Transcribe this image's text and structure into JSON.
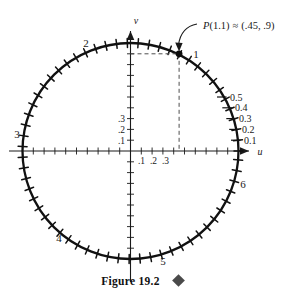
{
  "figure": {
    "caption": "Figure 19.2",
    "caption_marker": "filled-diamond",
    "background_color": "#ffffff",
    "ink_color": "#1a1a1a"
  },
  "axes": {
    "horizontal_label": "u",
    "vertical_label": "v",
    "horizontal_tick_labels": [
      ".1",
      ".2",
      ".3"
    ],
    "vertical_tick_labels": [
      ".1",
      ".2",
      ".3"
    ]
  },
  "circle": {
    "arc_length_labels": [
      "1",
      "2",
      "3",
      "4",
      "5",
      "6"
    ],
    "radius_tick_labels": [
      "0.1",
      "0.2",
      "0.3",
      "0.4",
      "0.5"
    ]
  },
  "point": {
    "annotation": "P(1.1) ≈ (.45, .9)",
    "annotation_prefix": "P",
    "annotation_arg": "(1.1)",
    "annotation_relation": "≈",
    "annotation_value": "(.45, .9)",
    "u": 0.45,
    "v": 0.9
  },
  "chart_data": {
    "type": "scatter",
    "title": "Figure 19.2",
    "xlabel": "u",
    "ylabel": "v",
    "xlim": [
      -1.1,
      1.1
    ],
    "ylim": [
      -1.1,
      1.1
    ],
    "grid": false,
    "legend": "none",
    "unit_circle": {
      "center": [
        0,
        0
      ],
      "radius": 1,
      "tick_spacing_arclength": 0.1,
      "tick_count": 63
    },
    "arc_length_markers": [
      {
        "label": "1",
        "arclength": 1.0,
        "u": 0.5403,
        "v": 0.8415
      },
      {
        "label": "2",
        "arclength": 2.0,
        "u": -0.4161,
        "v": 0.9093
      },
      {
        "label": "3",
        "arclength": 3.0,
        "u": -0.99,
        "v": 0.1411
      },
      {
        "label": "4",
        "arclength": 4.0,
        "u": -0.6536,
        "v": -0.7568
      },
      {
        "label": "5",
        "arclength": 5.0,
        "u": 0.2837,
        "v": -0.9589
      },
      {
        "label": "6",
        "arclength": 6.0,
        "u": 0.9602,
        "v": -0.2794
      }
    ],
    "radius_scale_labels": [
      {
        "label": "0.1",
        "value": 0.1
      },
      {
        "label": "0.2",
        "value": 0.2
      },
      {
        "label": "0.3",
        "value": 0.3
      },
      {
        "label": "0.4",
        "value": 0.4
      },
      {
        "label": "0.5",
        "value": 0.5
      }
    ],
    "axis_tick_labels_x": [
      {
        "label": ".1",
        "value": 0.1
      },
      {
        "label": ".2",
        "value": 0.2
      },
      {
        "label": ".3",
        "value": 0.3
      }
    ],
    "axis_tick_labels_y": [
      {
        "label": ".1",
        "value": 0.1
      },
      {
        "label": ".2",
        "value": 0.2
      },
      {
        "label": ".3",
        "value": 0.3
      }
    ],
    "points": [
      {
        "label": "P(1.1) ≈ (.45, .9)",
        "u": 0.45,
        "v": 0.9,
        "arclength": 1.1
      }
    ],
    "annotations": [
      {
        "text": "P(1.1) ≈ (.45, .9)",
        "target_u": 0.45,
        "target_v": 0.9,
        "style": "curved-arrow"
      },
      {
        "text": "dashed projection to v-axis",
        "from": [
          0.45,
          0.9
        ],
        "to": [
          0,
          0.9
        ]
      },
      {
        "text": "dashed projection to u-axis",
        "from": [
          0.45,
          0.9
        ],
        "to": [
          0.45,
          0
        ]
      }
    ]
  }
}
